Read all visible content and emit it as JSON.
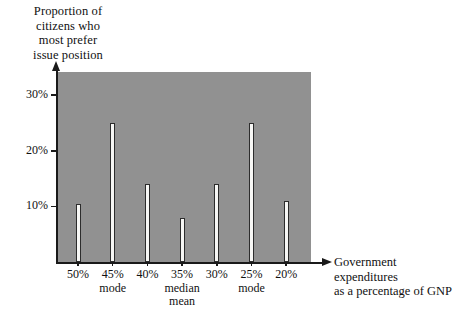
{
  "chart_data": {
    "type": "bar",
    "title": "Proportion of\ncitizens who\nmost prefer\nissue position",
    "ylabel": "Proportion of citizens who most prefer issue position",
    "xlabel": "Government expenditures\nas a percentage of GNP",
    "categories": [
      "50%",
      "45%",
      "40%",
      "35%",
      "30%",
      "25%",
      "20%"
    ],
    "values": [
      10.5,
      25.0,
      14.0,
      8.0,
      14.0,
      25.0,
      11.0
    ],
    "category_annotations": [
      "",
      "mode",
      "",
      "median\nmean",
      "",
      "mode",
      ""
    ],
    "ytick_labels": [
      "30%",
      "20%",
      "10%"
    ],
    "ytick_values": [
      30,
      20,
      10
    ],
    "ylim": [
      0,
      34
    ],
    "grid": false,
    "legend": null,
    "plot_background_color": "#919191",
    "bar_fill_color": "#f7f7f5",
    "bar_edge_color": "#2c2c2c",
    "axis_color": "#1a1a1a",
    "page_background_color": "#ffffff"
  }
}
